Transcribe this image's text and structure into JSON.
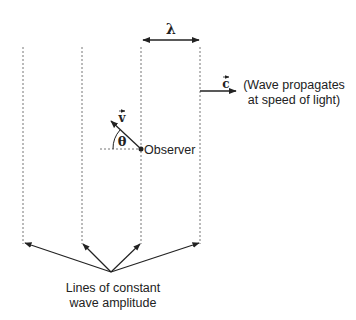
{
  "diagram": {
    "wavelength_label": "λ",
    "speed_vector_label": "c",
    "velocity_vector_label": "v",
    "angle_label": "θ",
    "observer_label": "Observer",
    "propagation_note": {
      "line1": "(Wave propagates",
      "line2": "at speed of light)"
    },
    "wavefront_caption": {
      "line1": "Lines of constant",
      "line2": "wave amplitude"
    },
    "wavefront_count": 4,
    "colors": {
      "line": "#222222",
      "dashed": "#777777",
      "background": "#ffffff"
    }
  }
}
